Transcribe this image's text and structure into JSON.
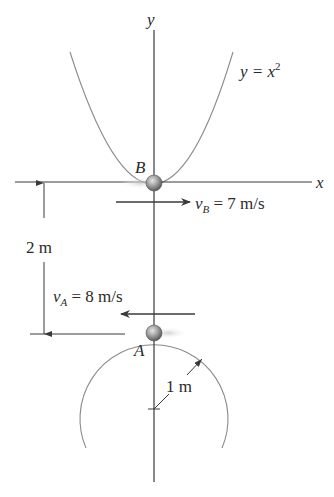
{
  "diagram": {
    "axes": {
      "x_label": "x",
      "y_label": "y"
    },
    "curve": {
      "equation_lhs": "y = x",
      "equation_exp": "2"
    },
    "particles": {
      "B": {
        "label": "B",
        "velocity_symbol": "v",
        "velocity_sub": "B",
        "velocity_value": " = 7 m/s",
        "direction": "right"
      },
      "A": {
        "label": "A",
        "velocity_symbol": "v",
        "velocity_sub": "A",
        "velocity_value": " = 8 m/s",
        "direction": "left"
      }
    },
    "dimensions": {
      "separation": "2 m",
      "radius": "1 m"
    },
    "colors": {
      "line": "#3a3a3a",
      "curve": "#8a8a8a",
      "ball": "#9a9a9a",
      "text": "#2a2a2a"
    }
  }
}
